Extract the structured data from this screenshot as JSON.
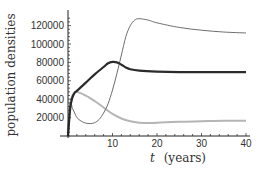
{
  "chart_data": {
    "type": "line",
    "title": "",
    "xlabel": "t (years)",
    "xlabel_var": "t",
    "xlabel_unit": "(years)",
    "ylabel": "population densities",
    "xlim": [
      0,
      40
    ],
    "ylim": [
      0,
      130000
    ],
    "xticks": [
      10,
      20,
      30,
      40
    ],
    "yticks": [
      20000,
      40000,
      60000,
      80000,
      100000,
      120000
    ],
    "xtick_labels": [
      "10",
      "20",
      "30",
      "40"
    ],
    "ytick_labels": [
      "20000",
      "40000",
      "60000",
      "80000",
      "100000",
      "120000"
    ],
    "grid": false,
    "legend": null,
    "series": [
      {
        "name": "thick-dark",
        "color": "#2b2b2b",
        "width": 2.2,
        "x": [
          0,
          0.5,
          1,
          1.5,
          2,
          4,
          6,
          8,
          9,
          10,
          11,
          12,
          13,
          14,
          16,
          20,
          25,
          30,
          35,
          40
        ],
        "values": [
          0,
          30000,
          42000,
          47000,
          49000,
          58000,
          67000,
          75000,
          79000,
          80500,
          80000,
          77500,
          74500,
          72500,
          71000,
          70000,
          69500,
          69500,
          69500,
          69500
        ]
      },
      {
        "name": "thin-medium",
        "color": "#6e6e6e",
        "width": 1,
        "x": [
          0,
          0.5,
          1,
          1.5,
          2,
          3,
          4,
          5,
          6,
          7,
          8,
          9,
          10,
          11,
          12,
          13,
          14,
          15,
          16,
          18,
          20,
          25,
          30,
          35,
          40
        ],
        "values": [
          0,
          35000,
          30000,
          25000,
          20000,
          16000,
          14000,
          13500,
          14500,
          18000,
          25000,
          35000,
          50000,
          68000,
          88000,
          108000,
          120000,
          126000,
          127500,
          126000,
          123000,
          118000,
          115000,
          113000,
          112000
        ]
      },
      {
        "name": "light-gray",
        "color": "#b5b5b5",
        "width": 2,
        "x": [
          0,
          0.5,
          1,
          1.5,
          2,
          4,
          6,
          8,
          10,
          12,
          14,
          16,
          18,
          20,
          25,
          30,
          35,
          40
        ],
        "values": [
          0,
          35000,
          44000,
          47500,
          48000,
          44000,
          38000,
          31000,
          24000,
          19000,
          16000,
          14500,
          14000,
          14500,
          15500,
          16000,
          16500,
          16500
        ]
      }
    ]
  }
}
